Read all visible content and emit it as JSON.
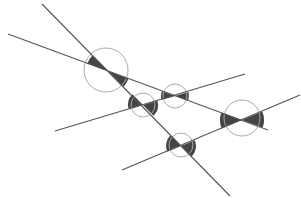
{
  "diagram": {
    "colors": {
      "background": "#ffffff",
      "line": "#555555",
      "circle": "#aaaaaa",
      "wedge": "#444444"
    },
    "lines": [
      {
        "id": "A",
        "x1": 42,
        "y1": 4,
        "x2": 230,
        "y2": 196
      },
      {
        "id": "B",
        "x1": 8,
        "y1": 34,
        "x2": 268,
        "y2": 130
      },
      {
        "id": "C",
        "x1": 55,
        "y1": 131,
        "x2": 245,
        "y2": 74
      },
      {
        "id": "D",
        "x1": 122,
        "y1": 170,
        "x2": 300,
        "y2": 95
      }
    ],
    "intersections": [
      {
        "id": "AB",
        "lines": [
          "A",
          "B"
        ],
        "cx": 108,
        "cy": 71,
        "circle_cx": 106,
        "circle_cy": 70,
        "r": 22,
        "wedge_r": 22
      },
      {
        "id": "AC",
        "lines": [
          "A",
          "C"
        ],
        "cx": 143,
        "cy": 105,
        "circle_cx": 143,
        "circle_cy": 105,
        "r": 12,
        "wedge_r": 15
      },
      {
        "id": "BC",
        "lines": [
          "B",
          "C"
        ],
        "cx": 175,
        "cy": 96,
        "circle_cx": 175,
        "circle_cy": 96,
        "r": 12,
        "wedge_r": 14
      },
      {
        "id": "AD",
        "lines": [
          "A",
          "D"
        ],
        "cx": 181,
        "cy": 146,
        "circle_cx": 181,
        "circle_cy": 145,
        "r": 12,
        "wedge_r": 15
      },
      {
        "id": "BD",
        "lines": [
          "B",
          "D"
        ],
        "cx": 242,
        "cy": 120,
        "circle_cx": 242,
        "circle_cy": 118,
        "r": 18,
        "wedge_r": 22
      }
    ]
  }
}
